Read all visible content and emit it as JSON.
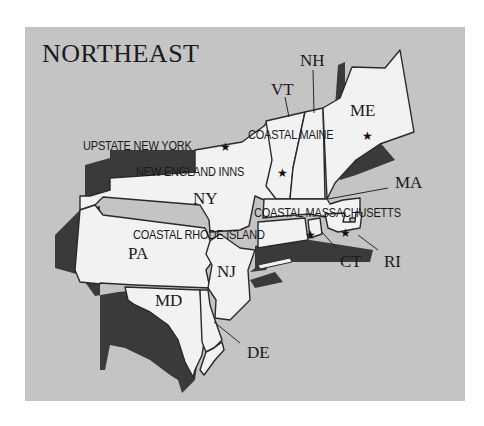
{
  "title": "NORTHEAST",
  "colors": {
    "background": "#ffffff",
    "panel": "#c4c4c4",
    "land": "#f2f2f2",
    "shadow": "#3a3a3a",
    "border": "#2a2a2a",
    "text": "#1a1a1a"
  },
  "states": [
    {
      "abbr": "NH"
    },
    {
      "abbr": "VT"
    },
    {
      "abbr": "ME"
    },
    {
      "abbr": "NY"
    },
    {
      "abbr": "MA"
    },
    {
      "abbr": "PA"
    },
    {
      "abbr": "NJ"
    },
    {
      "abbr": "CT"
    },
    {
      "abbr": "RI"
    },
    {
      "abbr": "MD"
    },
    {
      "abbr": "DE"
    }
  ],
  "destinations": [
    {
      "label": "UPSTATE NEW YORK",
      "icon": "star-icon"
    },
    {
      "label": "COASTAL MAINE",
      "icon": "star-icon"
    },
    {
      "label": "NEW ENGLAND INNS",
      "icon": "star-icon"
    },
    {
      "label": "COASTAL MASSACHUSETTS",
      "icon": "star-icon"
    },
    {
      "label": "COASTAL RHODE ISLAND",
      "icon": "star-icon"
    }
  ],
  "star_glyph": "★"
}
